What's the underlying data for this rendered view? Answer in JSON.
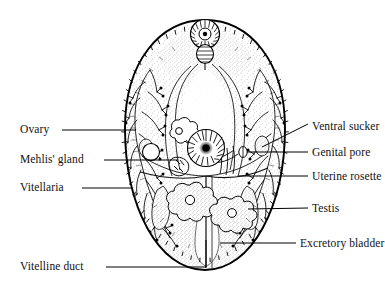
{
  "figure": {
    "background_color": "#ffffff",
    "ink_color": "#000000",
    "stipple_color": "#8c8c8c"
  },
  "labels": {
    "left": [
      {
        "id": "ovary",
        "text": "Ovary",
        "x": 20,
        "y": 130,
        "leader_from_x": 62,
        "leader_from_y": 130,
        "leader_to_x": 136,
        "leader_to_y": 130
      },
      {
        "id": "mehlis-gland",
        "text": "Mehlis' gland",
        "x": 20,
        "y": 160,
        "leader_from_x": 104,
        "leader_from_y": 160,
        "leader_to_x": 178,
        "leader_to_y": 160
      },
      {
        "id": "vitellaria",
        "text": "Vitellaria",
        "x": 20,
        "y": 188,
        "leader_from_x": 82,
        "leader_from_y": 188,
        "leader_to_x": 132,
        "leader_to_y": 188
      },
      {
        "id": "vitelline-duct",
        "text": "Vitelline duct",
        "x": 20,
        "y": 267,
        "leader_from_x": 106,
        "leader_from_y": 267,
        "leader_to_x": 210,
        "leader_to_y": 267
      }
    ],
    "right": [
      {
        "id": "ventral-sucker",
        "text": "Ventral sucker",
        "x": 312,
        "y": 127,
        "leader_from_x": 308,
        "leader_from_y": 124,
        "leader_to_x": 262,
        "leader_to_y": 146,
        "diagonal": true
      },
      {
        "id": "genital-pore",
        "text": "Genital pore",
        "x": 312,
        "y": 154,
        "leader_from_x": 308,
        "leader_from_y": 152,
        "leader_to_x": 248,
        "leader_to_y": 152
      },
      {
        "id": "uterine-rosette",
        "text": "Uterine rosette",
        "x": 312,
        "y": 178,
        "leader_from_x": 308,
        "leader_from_y": 176,
        "leader_to_x": 240,
        "leader_to_y": 176
      },
      {
        "id": "testis",
        "text": "Testis",
        "x": 312,
        "y": 210,
        "leader_from_x": 308,
        "leader_from_y": 208,
        "leader_to_x": 262,
        "leader_to_y": 208
      },
      {
        "id": "excretory-bladder",
        "text": "Excretory bladder",
        "x": 300,
        "y": 245,
        "leader_from_x": 296,
        "leader_from_y": 243,
        "leader_to_x": 224,
        "leader_to_y": 243
      }
    ]
  },
  "anatomy": {
    "body_outline": {
      "name": "body-outline",
      "shape": "ovoid",
      "cx": 205,
      "cy": 145,
      "rx": 80,
      "ry": 125,
      "spiny_margin": true
    },
    "oral_sucker": {
      "name": "oral-sucker",
      "cx": 205,
      "cy": 34,
      "r": 14,
      "radial_striations": 34
    },
    "pharynx": {
      "name": "pharynx",
      "cx": 205,
      "cy": 54,
      "rx": 8,
      "ry": 9
    },
    "ventral_sucker": {
      "name": "ventral-sucker",
      "cx": 206,
      "cy": 148,
      "r": 18,
      "radial_striations": 40,
      "core_r": 6
    },
    "ovary": {
      "name": "ovary",
      "cx": 151,
      "cy": 152,
      "r": 8
    },
    "uterine_rosette": {
      "name": "uterine-rosette",
      "cx": 179,
      "cy": 131,
      "r": 11,
      "lobes": 7
    },
    "testes": [
      {
        "name": "testis-left",
        "cx": 190,
        "cy": 200,
        "r": 15,
        "lobes": 9
      },
      {
        "name": "testis-right",
        "cx": 232,
        "cy": 213,
        "r": 14,
        "lobes": 9
      }
    ],
    "vitellaria": {
      "name": "vitellaria",
      "sides": [
        "left",
        "right"
      ],
      "branching": "dendritic",
      "follicles": true
    },
    "vitelline_duct": {
      "name": "vitelline-duct",
      "path": "vertical-midline-to-bottom"
    },
    "excretory_bladder": {
      "name": "excretory-bladder",
      "position": "posterior-midline"
    },
    "ceca": {
      "name": "intestinal-ceca",
      "count": 2
    }
  }
}
